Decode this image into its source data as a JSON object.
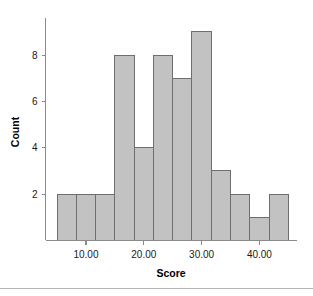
{
  "chart_data": {
    "type": "bar",
    "title": "",
    "subtitle": "",
    "xlabel": "Score",
    "ylabel": "Count",
    "bin_width": 3.3333,
    "bin_starts": [
      5.0,
      8.3333,
      11.6667,
      15.0,
      18.3333,
      21.6667,
      25.0,
      28.3333,
      31.6667,
      35.0,
      38.3333,
      41.6667
    ],
    "bin_ends": [
      8.3333,
      11.6667,
      15.0,
      18.3333,
      21.6667,
      25.0,
      28.3333,
      31.6667,
      35.0,
      38.3333,
      41.6667,
      45.0
    ],
    "categories": [
      "5.0-8.3",
      "8.3-11.7",
      "11.7-15.0",
      "15.0-18.3",
      "18.3-21.7",
      "21.7-25.0",
      "25.0-28.3",
      "28.3-31.7",
      "31.7-35.0",
      "35.0-38.3",
      "38.3-41.7",
      "41.7-45.0"
    ],
    "values": [
      2,
      2,
      2,
      8,
      4,
      8,
      7,
      9,
      3,
      2,
      1,
      2
    ],
    "xlim": [
      3.0,
      46.5
    ],
    "ylim": [
      0,
      9.6
    ],
    "xticks": [
      10,
      20,
      30,
      40
    ],
    "xtick_labels": [
      "10.00",
      "20.00",
      "30.00",
      "40.00"
    ],
    "yticks": [
      2,
      4,
      6,
      8
    ],
    "ytick_labels": [
      "2",
      "4",
      "6",
      "8"
    ],
    "grid": false,
    "legend": null,
    "bar_fill_color": "#c2c2c2",
    "bar_edge_color": "#6e6e6e",
    "axis_color": "#8a8a8a",
    "background_color": "#ffffff",
    "total_count": 50
  },
  "figure": {
    "axis_titles": {
      "x": "Score",
      "y": "Count"
    },
    "divider_label": ""
  }
}
